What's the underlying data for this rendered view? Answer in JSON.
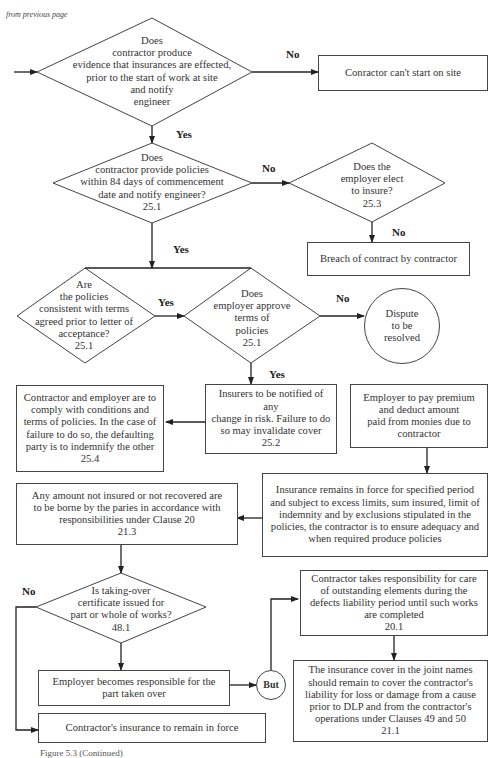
{
  "page": {
    "continuation_note": "from previous page",
    "caption": "Figure 5.3 (Continued)"
  },
  "decisions": {
    "d1": {
      "text": "Does\ncontractor produce\nevidence that insurances are effected,\nprior to the start of work at site\nand notify\nengineer",
      "clause": ""
    },
    "d2": {
      "text": "Does\ncontractor provide policies\nwithin 84 days of commencement\ndate and notify engineer?\n25.1"
    },
    "d3": {
      "text": "Does the\nemployer elect\nto insure?\n25.3"
    },
    "d4": {
      "text": "Are\nthe policies\nconsistent with terms\nagreed prior to letter of\nacceptance?\n25.1"
    },
    "d5": {
      "text": "Does\nemployer approve\nterms of\npolicies\n25.1"
    },
    "d6": {
      "text": "Is taking-over\ncertificate issued for\npart or whole of works?\n48.1"
    }
  },
  "processes": {
    "p_cant_start": "Conractor can't start on site",
    "p_breach": "Breach of contract by contractor",
    "p_comply": "Contractor and employer are to\ncomply with conditions and\nterms of policies. In the case of\nfailure to do so, the defaulting\nparty is to indemnify the other\n25.4",
    "p_insurers": "Insurers to be notified of any\nchange in risk. Failure to do\nso may invalidate cover\n25.2",
    "p_premium": "Employer to pay premium\nand deduct amount\npaid from monies due to\ncontractor",
    "p_remains": "Insurance remains in force for specified period\nand subject to excess limits, sum insured, limit of\nindemnity and by exclusions stipulated in the\npolicies, the contractor is to ensure adequacy and\nwhen required produce policies",
    "p_amount": "Any amount not insured or not recovered are\nto be borne by the paries in accordance with\nresponsibilities under Clause 20\n21.3",
    "p_outstanding": "Contractor takes responsibility for care\nof outstanding elements during the\ndefects liability period until such works\nare completed\n20.1",
    "p_employer_resp": "Employer becomes responsible for the\npart taken over",
    "p_joint_names": "The insurance cover in the joint names\nshould remain to cover the contractor's\nliability for loss or damage from a cause\nprior to DLP and from the contractor's\noperations under Clauses 49 and 50\n21.1",
    "p_remain_force": "Contractor's insurance to remain in force"
  },
  "terminals": {
    "dispute": "Dispute\nto be\nresolved",
    "but": "But"
  },
  "edge_labels": {
    "d1_no": "No",
    "d1_yes": "Yes",
    "d2_no": "No",
    "d2_yes": "Yes",
    "d3_no": "No",
    "d4_yes": "Yes",
    "d5_no": "No",
    "d5_yes": "Yes",
    "d6_no": "No"
  },
  "colors": {
    "line": "#333333",
    "text": "#333333",
    "background": "#ffffff"
  }
}
